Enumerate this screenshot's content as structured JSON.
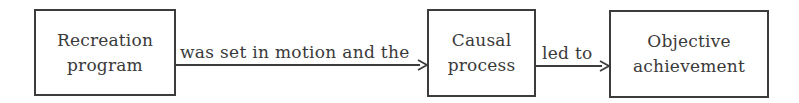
{
  "diagram": {
    "type": "flowchart",
    "direction": "left-to-right",
    "nodes": [
      {
        "id": "recreation-program",
        "label": "Recreation\nprogram"
      },
      {
        "id": "causal-process",
        "label": "Causal\nprocess"
      },
      {
        "id": "objective-achievement",
        "label": "Objective\nachievement"
      }
    ],
    "edges": [
      {
        "from": "recreation-program",
        "to": "causal-process",
        "label": "was set in motion and the"
      },
      {
        "from": "causal-process",
        "to": "objective-achievement",
        "label": "led to"
      }
    ],
    "colors": {
      "stroke": "#3c3c3c",
      "text": "#3a3a3a",
      "background": "#ffffff"
    }
  }
}
